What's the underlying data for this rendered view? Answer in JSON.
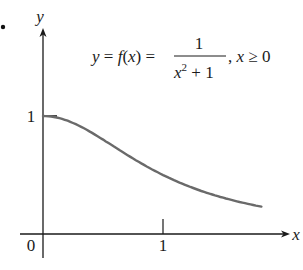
{
  "chart_data": {
    "type": "line",
    "function": "1/(x^2+1)",
    "domain_note": "x ≥ 0",
    "xlabel": "x",
    "ylabel": "y",
    "xlim": [
      0,
      1.9
    ],
    "ylim": [
      0,
      1.6
    ],
    "grid": false,
    "legend": null,
    "x_ticks": [
      0,
      1
    ],
    "x_tick_labels": [
      "0",
      "1"
    ],
    "y_ticks": [
      1
    ],
    "y_tick_labels": [
      "1"
    ],
    "series": [
      {
        "name": "f(x) = 1/(x^2+1)",
        "color": "#6a6a6a",
        "x": [
          0,
          0.1,
          0.2,
          0.3,
          0.4,
          0.5,
          0.6,
          0.7,
          0.8,
          0.9,
          1.0,
          1.1,
          1.2,
          1.3,
          1.4,
          1.5,
          1.6,
          1.7,
          1.82
        ],
        "y": [
          1.0,
          0.99,
          0.962,
          0.917,
          0.862,
          0.8,
          0.735,
          0.671,
          0.61,
          0.552,
          0.5,
          0.452,
          0.41,
          0.372,
          0.338,
          0.308,
          0.281,
          0.257,
          0.232
        ]
      }
    ]
  },
  "labels": {
    "bullet": "•",
    "y_axis": "y",
    "x_axis": "x",
    "origin": "0",
    "x_tick_1": "1",
    "y_tick_1": "1",
    "formula_lhs": "y = f(x) =",
    "formula_num": "1",
    "formula_den_base": "x",
    "formula_den_exp": "2",
    "formula_den_rest": " + 1",
    "formula_cond": ",  x ≥ 0"
  },
  "colors": {
    "axis": "#1a1a1a",
    "curve": "#6a6a6a"
  }
}
